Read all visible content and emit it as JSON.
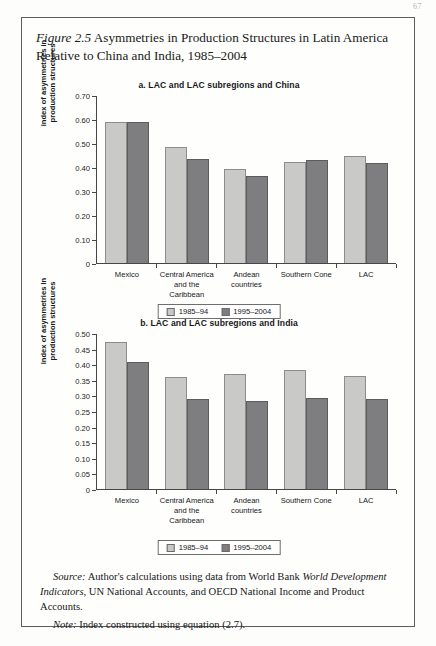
{
  "folio": "67",
  "figure": {
    "number": "Figure 2.5",
    "title": " Asymmetries in Production Structures in Latin America Relative to China and India, 1985–2004"
  },
  "legend": {
    "series1": "1985–94",
    "series2": "1995–2004"
  },
  "axis": {
    "ylabel_line1": "index of asymmetries in",
    "ylabel_line2": "production structures"
  },
  "notes": {
    "source_label": "Source:",
    "source_text": " Author's calculations using data from World Bank ",
    "source_italic": "World Development Indicators",
    "source_text2": ", UN National Accounts, and OECD National Income and Product Accounts.",
    "note_label": "Note:",
    "note_text": " Index constructed using equation (2.7)."
  },
  "chart_data": [
    {
      "id": "a",
      "type": "bar",
      "title": "a. LAC and LAC subregions and China",
      "xlabel": "",
      "ylabel": "index of asymmetries in production structures",
      "ylim": [
        0,
        0.7
      ],
      "yticks": [
        0,
        0.1,
        0.2,
        0.3,
        0.4,
        0.5,
        0.6,
        0.7
      ],
      "ytick_labels": [
        "0",
        "0.10",
        "0.20",
        "0.30",
        "0.40",
        "0.50",
        "0.60",
        "0.70"
      ],
      "grid": false,
      "legend_position": "bottom",
      "categories": [
        "Mexico",
        "Central America and the Caribbean",
        "Andean countries",
        "Southern Cone",
        "LAC"
      ],
      "series": [
        {
          "name": "1985–94",
          "values": [
            0.59,
            0.485,
            0.395,
            0.425,
            0.45
          ]
        },
        {
          "name": "1995–2004",
          "values": [
            0.59,
            0.435,
            0.365,
            0.43,
            0.42
          ]
        }
      ]
    },
    {
      "id": "b",
      "type": "bar",
      "title": "b. LAC and LAC subregions and India",
      "xlabel": "",
      "ylabel": "index of asymmetries in production structures",
      "ylim": [
        0,
        0.5
      ],
      "yticks": [
        0,
        0.05,
        0.1,
        0.15,
        0.2,
        0.25,
        0.3,
        0.35,
        0.4,
        0.45,
        0.5
      ],
      "ytick_labels": [
        "0",
        "0.05",
        "0.10",
        "0.15",
        "0.20",
        "0.25",
        "0.30",
        "0.35",
        "0.40",
        "0.45",
        "0.50"
      ],
      "grid": false,
      "legend_position": "bottom",
      "categories": [
        "Mexico",
        "Central America and the Caribbean",
        "Andean countries",
        "Southern Cone",
        "LAC"
      ],
      "series": [
        {
          "name": "1985–94",
          "values": [
            0.475,
            0.36,
            0.37,
            0.385,
            0.365
          ]
        },
        {
          "name": "1995–2004",
          "values": [
            0.41,
            0.29,
            0.285,
            0.295,
            0.29
          ]
        }
      ]
    }
  ],
  "colors": {
    "series1": "#c9c9c7",
    "series2": "#7e7e80",
    "axis": "#46464a",
    "frame": "#5d5d5a"
  }
}
